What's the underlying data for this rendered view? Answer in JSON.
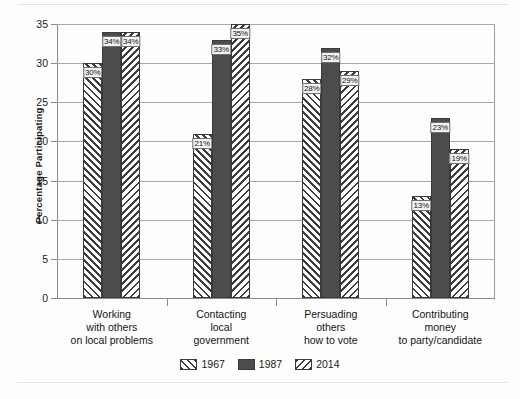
{
  "chart_data": {
    "type": "bar",
    "title": "",
    "xlabel": "",
    "ylabel": "Percentage Participating",
    "ylim": [
      0,
      35
    ],
    "yticks": [
      0,
      5,
      10,
      15,
      20,
      25,
      30,
      35
    ],
    "grid": true,
    "legend_position": "bottom-center",
    "categories": [
      "Working\nwith others\non local problems",
      "Contacting\nlocal\ngovernment",
      "Persuading\nothers\nhow to vote",
      "Contributing\nmoney\nto party/candidate"
    ],
    "series": [
      {
        "name": "1967",
        "pattern": "forward-diagonal-hatch",
        "color": "#ffffff",
        "values": [
          30,
          21,
          28,
          13
        ],
        "labels": [
          "30%",
          "21%",
          "28%",
          "13%"
        ]
      },
      {
        "name": "1987",
        "pattern": "solid",
        "color": "#4c4c4c",
        "values": [
          34,
          33,
          32,
          23
        ],
        "labels": [
          "34%",
          "33%",
          "32%",
          "23%"
        ]
      },
      {
        "name": "2014",
        "pattern": "back-diagonal-hatch",
        "color": "#ffffff",
        "values": [
          34,
          35,
          29,
          19
        ],
        "labels": [
          "34%",
          "35%",
          "29%",
          "19%"
        ]
      }
    ]
  },
  "legend": {
    "items": [
      {
        "label": "1967"
      },
      {
        "label": "1987"
      },
      {
        "label": "2014"
      }
    ]
  },
  "axis": {
    "y_title": "Percentage Participating",
    "y_tick_labels": [
      "35",
      "30",
      "25",
      "20",
      "15",
      "10",
      "5",
      "0"
    ]
  }
}
